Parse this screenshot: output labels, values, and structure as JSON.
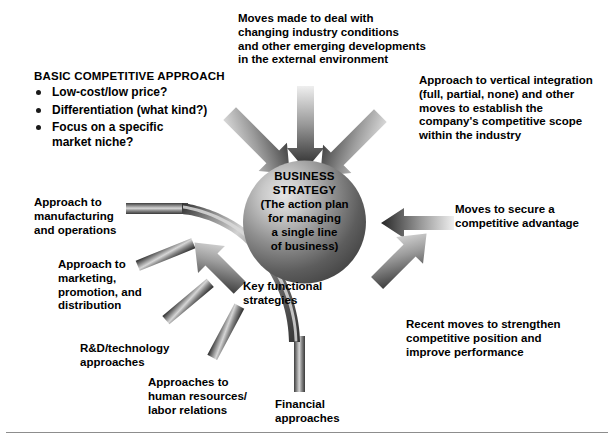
{
  "diagram": {
    "center": {
      "name": "business-strategy-sphere",
      "heading_line1": "BUSINESS",
      "heading_line2": "STRATEGY",
      "subtext": "(The action plan\nfor managing\na single line\nof business)"
    },
    "basic_approach": {
      "heading": "BASIC COMPETITIVE APPROACH",
      "items": [
        "Low-cost/low price?",
        "Differentiation (what kind?)",
        "Focus on a specific\nmarket niche?"
      ]
    },
    "callouts": {
      "top": "Moves made to deal with\nchanging industry conditions\nand other emerging developments\nin the  external environment",
      "upper_right": "Approach to vertical integration\n(full, partial, none) and other\nmoves to establish the\ncompany's competitive scope\nwithin the industry",
      "right": "Moves to secure a\ncompetitive advantage",
      "lower_right": "Recent moves to strengthen\ncompetitive position and\nimprove performance",
      "key_functional": "Key functional\nstrategies"
    },
    "functional_spokes": [
      "Approach to\nmanufacturing\nand operations",
      "Approach to\nmarketing,\npromotion, and\ndistribution",
      "R&D/technology\napproaches",
      "Approaches to\nhuman resources/\nlabor relations",
      "Financial\napproaches"
    ],
    "colors": {
      "ink": "#000000",
      "arrow_dark": "#2a2a2a",
      "arrow_light": "#e2e2e2",
      "sphere_dark": "#4a4a4a",
      "sphere_light": "#d8d8d8",
      "rule": "#8d8d8d"
    }
  }
}
